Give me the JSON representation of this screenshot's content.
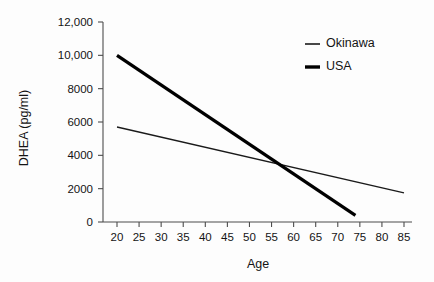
{
  "chart_data": {
    "type": "line",
    "title": "",
    "xlabel": "Age",
    "ylabel": "DHEA (pg/ml)",
    "xlim": [
      20,
      85
    ],
    "ylim": [
      0,
      12000
    ],
    "grid": false,
    "legend_position": "top-right",
    "xticks": [
      20,
      25,
      30,
      35,
      40,
      45,
      50,
      55,
      60,
      65,
      70,
      75,
      80,
      85
    ],
    "xtick_labels": [
      "20",
      "25",
      "30",
      "35",
      "40",
      "45",
      "50",
      "55",
      "60",
      "65",
      "70",
      "75",
      "80",
      "85"
    ],
    "yticks": [
      0,
      2000,
      4000,
      6000,
      8000,
      10000,
      12000
    ],
    "ytick_labels": [
      "0",
      "2000",
      "4000",
      "6000",
      "8000",
      "10,000",
      "12,000"
    ],
    "series": [
      {
        "name": "Okinawa",
        "style": "thin",
        "color": "#1a1a1a",
        "x": [
          20,
          85
        ],
        "values": [
          5700,
          1750
        ]
      },
      {
        "name": "USA",
        "style": "thick",
        "color": "#000000",
        "x": [
          20,
          74
        ],
        "values": [
          10000,
          400
        ]
      }
    ],
    "annotations": [
      {
        "kind": "intersection",
        "x": 58,
        "y": 3500,
        "note": "Okinawa and USA trend lines cross"
      }
    ]
  },
  "legend": {
    "entries": [
      {
        "label": "Okinawa",
        "swatch": "thin-line-swatch"
      },
      {
        "label": "USA",
        "swatch": "thick-line-swatch"
      }
    ]
  },
  "axes": {
    "x_title": "Age",
    "y_title": "DHEA (pg/ml)"
  }
}
